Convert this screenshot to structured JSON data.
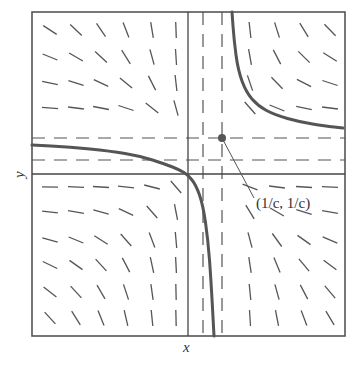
{
  "diagram": {
    "type": "slope-field",
    "axis_labels": {
      "x": "x",
      "y": "y"
    },
    "equilibrium_label": "(1/c, 1/c)",
    "colors": {
      "frame": "#555555",
      "axes": "#444444",
      "segments": "#555555",
      "isoclines": "#555555",
      "solution_curve": "#555555",
      "point": "#555555"
    },
    "frame": {
      "x0": 32,
      "y0": 12,
      "x1": 345,
      "y1": 336
    },
    "axes": {
      "x_axis_y": 174,
      "y_axis_x": 188
    },
    "equilibrium_point": {
      "x": 222,
      "y": 138
    },
    "isoclines": {
      "vertical": [
        203,
        222
      ],
      "horizontal": [
        138,
        160
      ]
    },
    "grid": {
      "cols": [
        50,
        76,
        101,
        126,
        152,
        176,
        203,
        222,
        250,
        277,
        304,
        330
      ],
      "rows": [
        30,
        57,
        83,
        108,
        138,
        160,
        187,
        212,
        240,
        265,
        292,
        318
      ]
    },
    "segment_length": 16,
    "solution_curves": [
      {
        "name": "lower-left-branch",
        "points": [
          [
            32,
            145
          ],
          [
            70,
            147
          ],
          [
            110,
            151
          ],
          [
            140,
            156
          ],
          [
            165,
            164
          ],
          [
            180,
            170
          ],
          [
            188,
            175
          ],
          [
            196,
            185
          ],
          [
            203,
            205
          ],
          [
            208,
            240
          ],
          [
            211,
            280
          ],
          [
            214,
            336
          ]
        ]
      },
      {
        "name": "upper-right-branch",
        "points": [
          [
            232,
            12
          ],
          [
            234,
            40
          ],
          [
            238,
            70
          ],
          [
            246,
            92
          ],
          [
            258,
            106
          ],
          [
            275,
            115
          ],
          [
            300,
            122
          ],
          [
            325,
            126
          ],
          [
            343,
            128
          ]
        ]
      }
    ]
  }
}
